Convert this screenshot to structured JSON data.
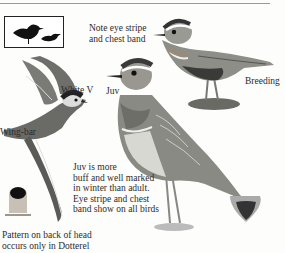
{
  "page": {
    "annotations": {
      "note_eye_stripe": [
        "Note eye stripe",
        "and chest band"
      ],
      "breeding": "Breeding",
      "white_v": "White V",
      "juv": "Juv",
      "wing_bar": "Wing-bar",
      "juv_note": [
        "Juv is more",
        "buff and well marked",
        "in winter than adult.",
        "Eye stripe and chest",
        "band show on all birds"
      ],
      "head_pattern_note": [
        "Pattern on back of head",
        "occurs only in Dotterel"
      ]
    },
    "figures": [
      {
        "name": "size-silhouettes",
        "description": "Silhouettes comparing size"
      },
      {
        "name": "breeding-adult",
        "description": "Adult in breeding plumage standing on tussock"
      },
      {
        "name": "flying-bird",
        "description": "Bird in flight showing white V and wing-bar"
      },
      {
        "name": "juvenile",
        "description": "Juvenile standing"
      },
      {
        "name": "head-pattern-left",
        "description": "Back of head pattern"
      },
      {
        "name": "head-pattern-right",
        "description": "Back of head pattern"
      }
    ],
    "colors": {
      "ink": "#2a2a2a",
      "paper": "#fdfdfb",
      "bird_grey": "#8a8a86",
      "bird_dark": "#3a3a38",
      "chest_rufous": "#9a8a78"
    }
  }
}
